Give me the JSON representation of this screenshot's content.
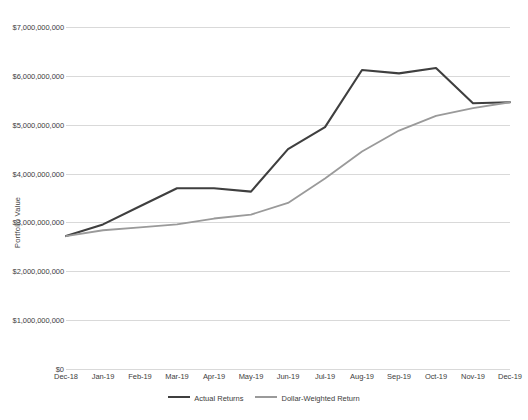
{
  "chart_data": {
    "type": "line",
    "title": "",
    "xlabel": "",
    "ylabel": "Portfolio Value",
    "grid": true,
    "legend_position": "bottom",
    "ylim": [
      0,
      7000000000
    ],
    "ytick_values": [
      0,
      1000000000,
      2000000000,
      3000000000,
      4000000000,
      5000000000,
      6000000000,
      7000000000
    ],
    "ytick_labels": [
      "$0",
      "$1,000,000,000",
      "$2,000,000,000",
      "$3,000,000,000",
      "$4,000,000,000",
      "$5,000,000,000",
      "$6,000,000,000",
      "$7,000,000,000"
    ],
    "categories": [
      "Dec-18",
      "Jan-19",
      "Feb-19",
      "Mar-19",
      "Apr-19",
      "May-19",
      "Jun-19",
      "Jul-19",
      "Aug-19",
      "Sep-19",
      "Oct-19",
      "Nov-19",
      "Dec-19"
    ],
    "series": [
      {
        "name": "Actual Returns",
        "color": "#3f3f3f",
        "width": 2.1,
        "values": [
          2720000000,
          2960000000,
          3330000000,
          3700000000,
          3700000000,
          3630000000,
          4500000000,
          4950000000,
          6120000000,
          6050000000,
          6160000000,
          5440000000,
          5460000000
        ]
      },
      {
        "name": "Dollar-Weighted Return",
        "color": "#9a9a9a",
        "width": 1.8,
        "values": [
          2720000000,
          2840000000,
          2900000000,
          2960000000,
          3080000000,
          3160000000,
          3400000000,
          3900000000,
          4450000000,
          4880000000,
          5180000000,
          5340000000,
          5460000000
        ]
      }
    ]
  }
}
